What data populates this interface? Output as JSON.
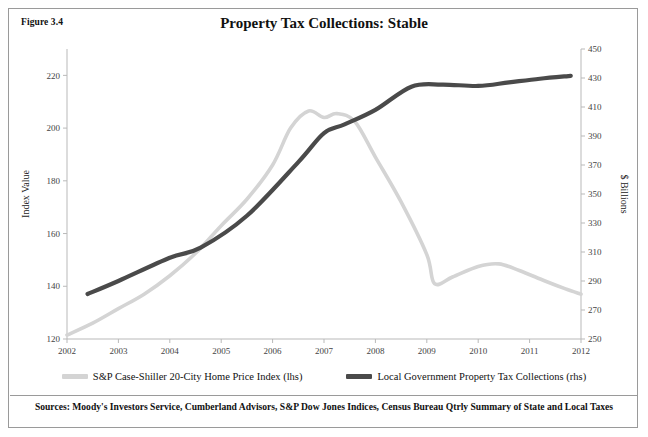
{
  "figure": {
    "label": "Figure 3.4",
    "title": "Property Tax Collections: Stable",
    "source_note": "Sources: Moody's Investors Service, Cumberland Advisors, S&P Dow Jones Indices, Census Bureau Qtrly Summary of State and Local Taxes"
  },
  "colors": {
    "series_light": "#d4d4d4",
    "series_dark": "#4a4a4a",
    "axis": "#b9b9b9",
    "border": "#9a9a9a",
    "text": "#111111"
  },
  "legend": {
    "items": [
      {
        "label": "S&P Case-Shiller 20-City Home Price Index (lhs)",
        "color": "#d4d4d4"
      },
      {
        "label": "Local Government Property Tax Collections (rhs)",
        "color": "#4a4a4a"
      }
    ]
  },
  "chart_data": {
    "type": "line",
    "title": "Property Tax Collections: Stable",
    "xlabel": "",
    "ylabel": "Index Value",
    "y2label": "$ Billions",
    "grid": false,
    "legend_position": "bottom",
    "xlim": [
      2002,
      2012
    ],
    "ylim": [
      120,
      230
    ],
    "y2lim": [
      250,
      450
    ],
    "xticks": [
      2002,
      2003,
      2004,
      2005,
      2006,
      2007,
      2008,
      2009,
      2010,
      2011,
      2012
    ],
    "yticks": [
      120,
      140,
      160,
      180,
      200,
      220
    ],
    "y2ticks": [
      250,
      270,
      290,
      310,
      330,
      350,
      370,
      390,
      410,
      430,
      450
    ],
    "series": [
      {
        "name": "S&P Case-Shiller 20-City Home Price Index (lhs)",
        "axis": "left",
        "color": "#d4d4d4",
        "x": [
          2002.0,
          2002.5,
          2003.0,
          2003.5,
          2004.0,
          2004.5,
          2005.0,
          2005.5,
          2006.0,
          2006.35,
          2006.7,
          2007.0,
          2007.25,
          2007.6,
          2008.0,
          2008.5,
          2009.0,
          2009.15,
          2009.5,
          2010.0,
          2010.4,
          2010.8,
          2011.3,
          2011.7,
          2012.0
        ],
        "y": [
          121.5,
          126.0,
          131.5,
          137.0,
          144.0,
          152.5,
          163.0,
          173.0,
          186.0,
          200.0,
          206.5,
          204.0,
          205.5,
          202.5,
          189.0,
          172.0,
          152.0,
          141.0,
          143.5,
          147.5,
          148.5,
          146.0,
          142.0,
          139.0,
          137.0
        ]
      },
      {
        "name": "Local Government Property Tax Collections (rhs)",
        "axis": "right",
        "color": "#4a4a4a",
        "x": [
          2002.4,
          2003.0,
          2004.0,
          2004.6,
          2005.5,
          2006.5,
          2007.0,
          2007.4,
          2008.0,
          2008.7,
          2009.3,
          2010.0,
          2010.6,
          2011.2,
          2011.8
        ],
        "y": [
          281.0,
          290.0,
          306.0,
          313.0,
          335.0,
          372.0,
          392.0,
          398.0,
          408.0,
          424.0,
          425.5,
          424.5,
          427.0,
          429.5,
          431.5
        ]
      }
    ]
  }
}
